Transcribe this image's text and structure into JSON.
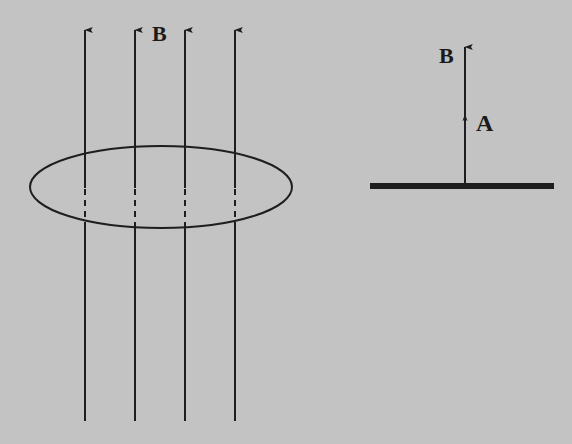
{
  "diagram": {
    "background": "#c3c3c3",
    "ink": "#1e1e1e",
    "left_figure": {
      "field_label": "B",
      "field_lines": [
        {
          "x": 85
        },
        {
          "x": 135
        },
        {
          "x": 185
        },
        {
          "x": 235
        }
      ],
      "loop": {
        "cx": 161,
        "cy": 187,
        "rx": 131,
        "ry": 41
      }
    },
    "right_figure": {
      "surface": {
        "x1": 370,
        "x2": 554,
        "y": 186
      },
      "vector_label_B": "B",
      "vector_label_A": "A"
    }
  }
}
